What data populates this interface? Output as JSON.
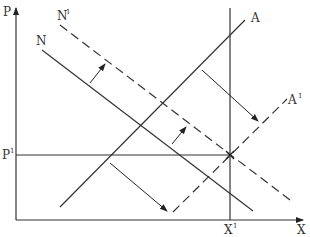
{
  "diagram": {
    "axes": {
      "y_label": "P",
      "x_label": "X"
    },
    "reference_labels": {
      "p1_base": "P",
      "p1_sup": "1",
      "x1_base": "X",
      "x1_sup": "1"
    },
    "curves": [
      {
        "id": "N",
        "label": "N",
        "sup": "",
        "style": "solid"
      },
      {
        "id": "N1",
        "label": "N",
        "sup": "1",
        "style": "dashed"
      },
      {
        "id": "A",
        "label": "A",
        "sup": "",
        "style": "solid"
      },
      {
        "id": "A1",
        "label": "A",
        "sup": "1",
        "style": "dashed"
      }
    ],
    "shift_arrows": [
      {
        "from": "N",
        "to": "N1",
        "direction": "up-right"
      },
      {
        "from": "N",
        "to": "N1",
        "direction": "up-right"
      },
      {
        "from": "A",
        "to": "A1",
        "direction": "down-right"
      },
      {
        "from": "A",
        "to": "A1",
        "direction": "down-right"
      }
    ]
  }
}
